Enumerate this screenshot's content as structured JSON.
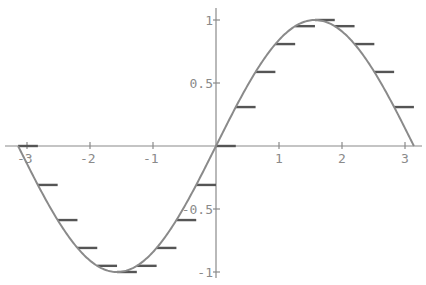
{
  "chart_data": {
    "type": "line",
    "title": "",
    "xlabel": "",
    "ylabel": "",
    "xlim": [
      -3.2,
      3.25
    ],
    "ylim": [
      -1,
      1
    ],
    "grid": false,
    "legend": null,
    "x_ticks": [
      {
        "value": -3,
        "label": "-3"
      },
      {
        "value": -2,
        "label": "-2"
      },
      {
        "value": -1,
        "label": "-1"
      },
      {
        "value": 1,
        "label": "1"
      },
      {
        "value": 2,
        "label": "2"
      },
      {
        "value": 3,
        "label": "3"
      }
    ],
    "y_ticks": [
      {
        "value": 1,
        "label": "1"
      },
      {
        "value": 0.5,
        "label": "0.5"
      },
      {
        "value": -0.5,
        "label": "-0.5"
      },
      {
        "value": -1,
        "label": "-1"
      }
    ],
    "series": [
      {
        "name": "sin(x)",
        "kind": "curve",
        "domain": [
          -3.14159,
          3.14159
        ],
        "color": "#8a8a8a"
      },
      {
        "name": "left-endpoint steps",
        "kind": "step-segments",
        "step_width": 0.31416,
        "color": "#555555",
        "x": [
          -3.1416,
          -2.8274,
          -2.5133,
          -2.1991,
          -1.885,
          -1.5708,
          -1.2566,
          -0.9425,
          -0.6283,
          -0.3142,
          0.0,
          0.3142,
          0.6283,
          0.9425,
          1.2566,
          1.5708,
          1.885,
          2.1991,
          2.5133,
          2.8274
        ],
        "y": [
          0.0,
          -0.309,
          -0.5878,
          -0.809,
          -0.9511,
          -1.0,
          -0.9511,
          -0.809,
          -0.5878,
          -0.309,
          0.0,
          0.309,
          0.5878,
          0.809,
          0.9511,
          1.0,
          0.9511,
          0.809,
          0.5878,
          0.309
        ]
      }
    ]
  },
  "layout": {
    "origin_px": [
      216,
      146
    ],
    "x_scale_px": 63,
    "y_scale_px": 126,
    "x_axis_range_px": [
      5,
      422
    ],
    "y_axis_range_px": [
      8,
      278
    ]
  }
}
